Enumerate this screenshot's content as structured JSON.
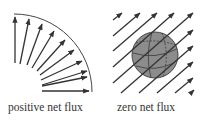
{
  "panels": [
    {
      "id": "positive",
      "caption": "positive net flux",
      "description": "vector field arrows exiting a curved surface (quarter arc)"
    },
    {
      "id": "zero",
      "caption": "zero net flux",
      "description": "uniform parallel diagonal field lines passing through a closed sphere"
    }
  ],
  "colors": {
    "arrow": "#333333",
    "sphere_fill": "#8c8c8c",
    "sphere_edge": "#444444",
    "background": "#ffffff"
  }
}
